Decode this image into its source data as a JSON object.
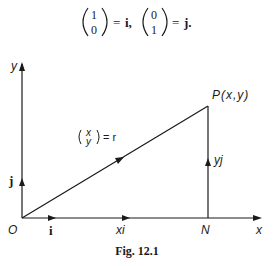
{
  "equation": {
    "vector1": {
      "top": "1",
      "bottom": "0"
    },
    "eq1_rhs": "i,",
    "vector2": {
      "top": "0",
      "bottom": "1"
    },
    "eq2_rhs": "j.",
    "equals": "="
  },
  "diagram": {
    "axes": {
      "x_label": "x",
      "y_label": "y",
      "origin_label": "O"
    },
    "point_P_label": "P(x,y)",
    "point_N_label": "N",
    "unit_i_label": "i",
    "unit_j_label": "j",
    "xi_label": "xi",
    "yj_label": "yj",
    "r_label": {
      "vec_top": "x",
      "vec_bottom": "y",
      "rhs": "= r"
    },
    "colors": {
      "line": "#1a1a1a",
      "background": "#ffffff"
    }
  },
  "caption": "Fig. 12.1"
}
